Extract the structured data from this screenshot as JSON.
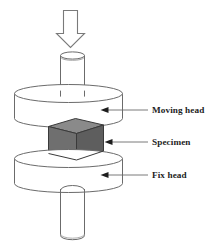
{
  "figure": {
    "background_color": "#ffffff",
    "line_color": "#6b6b6b",
    "text_color": "#1d1d1d"
  },
  "load_arrow": {
    "name": "downward-load-arrow",
    "direction": "down",
    "fill": "#ffffff",
    "stroke": "#7a7a7a"
  },
  "parts": {
    "upper_ram": {
      "label": "upper ram cylinder",
      "fill": "#ffffff",
      "stroke": "#6b6b6b"
    },
    "moving_head": {
      "label": "Moving head",
      "fill": "#ffffff",
      "stroke": "#6b6b6b"
    },
    "specimen": {
      "label": "Specimen",
      "top_face_fill": "#8a8a8a",
      "front_face_fill": "#6f6f6f",
      "side_face_fill": "#5e5e5e",
      "stroke": "#3a3a3a"
    },
    "fix_head": {
      "label": "Fix head",
      "fill": "#ffffff",
      "stroke": "#6b6b6b"
    },
    "lower_ram": {
      "label": "lower ram cylinder",
      "fill": "#ffffff",
      "stroke": "#6b6b6b"
    }
  },
  "callouts": [
    {
      "id": "moving-head",
      "text": "Moving head",
      "text_x": 152,
      "text_y": 113
    },
    {
      "id": "specimen",
      "text": "Specimen",
      "text_x": 152,
      "text_y": 145
    },
    {
      "id": "fix-head",
      "text": "Fix head",
      "text_x": 152,
      "text_y": 178
    }
  ]
}
